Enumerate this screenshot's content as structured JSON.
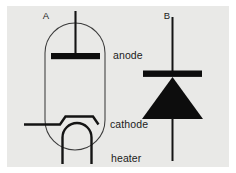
{
  "figure": {
    "background_color": "#ffffff",
    "panel_color": "#e9e9e7",
    "ink_color": "#0d0d0d",
    "envelope_color": "#3b3b3b",
    "panel_labels": {
      "left": "A",
      "right": "B"
    },
    "part_labels": {
      "anode": "anode",
      "cathode": "cathode",
      "heater": "heater"
    },
    "diagram_a": {
      "name": "vacuum-tube-diode",
      "elements": [
        "glass-envelope",
        "anode-plate",
        "anode-lead",
        "cathode",
        "cathode-lead",
        "heater-filament",
        "heater-leads"
      ]
    },
    "diagram_b": {
      "name": "semiconductor-diode",
      "elements": [
        "anode-lead",
        "triangle-body",
        "cathode-bar",
        "cathode-lead"
      ]
    }
  }
}
